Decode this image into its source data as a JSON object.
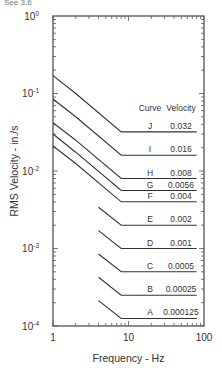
{
  "page": {
    "top_fragment": "See 3.6"
  },
  "chart_data": {
    "type": "line",
    "title": "",
    "xlabel": "Frequency - Hz",
    "ylabel": "RMS Velocity - in./s",
    "xscale": "log",
    "yscale": "log",
    "xlim": [
      1,
      100
    ],
    "ylim": [
      0.0001,
      1
    ],
    "grid": false,
    "x_ticks": [
      {
        "value": 1,
        "label": "1"
      },
      {
        "value": 10,
        "label": "10"
      },
      {
        "value": 100,
        "label": "100"
      }
    ],
    "y_ticks": [
      {
        "value": 1,
        "base": "10",
        "exp": "0"
      },
      {
        "value": 0.1,
        "base": "10",
        "exp": "-1"
      },
      {
        "value": 0.01,
        "base": "10",
        "exp": "-2"
      },
      {
        "value": 0.001,
        "base": "10",
        "exp": "-3"
      },
      {
        "value": 0.0001,
        "base": "10",
        "exp": "-4"
      }
    ],
    "table_headers": {
      "curve": "Curve",
      "velocity": "Velocity"
    },
    "series": [
      {
        "name": "J",
        "velocity": "0.032",
        "points": [
          [
            1,
            0.17
          ],
          [
            2,
            0.1
          ],
          [
            8,
            0.032
          ],
          [
            80,
            0.032
          ]
        ]
      },
      {
        "name": "I",
        "velocity": "0.016",
        "points": [
          [
            1,
            0.085
          ],
          [
            2,
            0.05
          ],
          [
            8,
            0.016
          ],
          [
            80,
            0.016
          ]
        ]
      },
      {
        "name": "H",
        "velocity": "0.008",
        "points": [
          [
            1,
            0.042
          ],
          [
            2,
            0.025
          ],
          [
            8,
            0.008
          ],
          [
            80,
            0.008
          ]
        ]
      },
      {
        "name": "G",
        "velocity": "0.0056",
        "points": [
          [
            1,
            0.03
          ],
          [
            2,
            0.0175
          ],
          [
            8,
            0.0056
          ],
          [
            80,
            0.0056
          ]
        ]
      },
      {
        "name": "F",
        "velocity": "0.004",
        "points": [
          [
            1,
            0.021
          ],
          [
            2,
            0.0125
          ],
          [
            8,
            0.004
          ],
          [
            80,
            0.004
          ]
        ]
      },
      {
        "name": "E",
        "velocity": "0.002",
        "points": [
          [
            4,
            0.0034
          ],
          [
            8,
            0.002
          ],
          [
            80,
            0.002
          ]
        ]
      },
      {
        "name": "D",
        "velocity": "0.001",
        "points": [
          [
            4,
            0.0017
          ],
          [
            8,
            0.001
          ],
          [
            80,
            0.001
          ]
        ]
      },
      {
        "name": "C",
        "velocity": "0.0005",
        "points": [
          [
            4,
            0.00085
          ],
          [
            8,
            0.0005
          ],
          [
            80,
            0.0005
          ]
        ]
      },
      {
        "name": "B",
        "velocity": "0.00025",
        "points": [
          [
            4,
            0.000425
          ],
          [
            8,
            0.00025
          ],
          [
            80,
            0.00025
          ]
        ]
      },
      {
        "name": "A",
        "velocity": "0.000125",
        "points": [
          [
            4,
            0.0002125
          ],
          [
            8,
            0.000125
          ],
          [
            80,
            0.000125
          ]
        ]
      }
    ]
  }
}
